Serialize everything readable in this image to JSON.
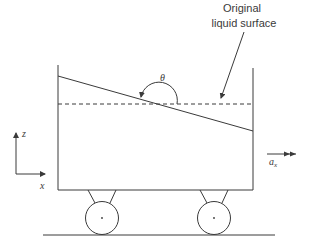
{
  "diagram": {
    "labels": {
      "original_surface_line1": "Original",
      "original_surface_line2": "liquid surface",
      "theta": "θ",
      "z_axis": "z",
      "x_axis": "x",
      "accel": "a",
      "accel_sub": "x"
    },
    "colors": {
      "stroke": "#3a3a3a",
      "background": "#ffffff"
    }
  }
}
